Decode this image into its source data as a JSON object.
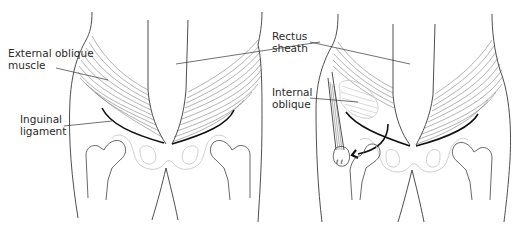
{
  "figure": {
    "left_panel": {
      "labels": {
        "external_oblique": [
          "External oblique",
          "muscle"
        ],
        "inguinal_ligament": [
          "Inguinal",
          "ligament"
        ]
      }
    },
    "right_panel": {
      "labels": {
        "rectus_sheath": [
          "Rectus",
          "sheath"
        ],
        "internal_oblique": [
          "Internal",
          "oblique"
        ]
      }
    },
    "colors": {
      "line": "#3a3a3a",
      "ligament": "#111111",
      "pelvis_outline": "#c9c9c9",
      "background": "#ffffff"
    }
  }
}
